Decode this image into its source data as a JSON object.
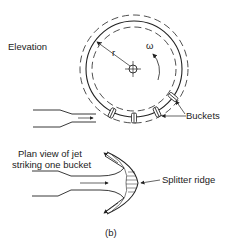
{
  "figure": {
    "label": "(b)",
    "elevation_label": "Elevation",
    "radius_label": "r",
    "omega_label": "ω",
    "buckets_label": "Buckets",
    "plan_view_label_line1": "Plan view of jet",
    "plan_view_label_line2": "striking one bucket",
    "splitter_label": "Splitter ridge"
  },
  "colors": {
    "ink": "#222222",
    "background": "#ffffff"
  }
}
